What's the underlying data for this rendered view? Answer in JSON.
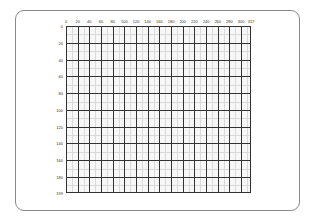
{
  "canvas": {
    "width_units": 317,
    "height_units": 199,
    "major_step": 20,
    "colors": {
      "frame_border": "#8a8a8a",
      "major_line": "#333333",
      "minor_line": "#d9d9d9",
      "grid_fill": "#f7f7f7"
    }
  },
  "x_axis": {
    "labels": [
      "0",
      "20",
      "40",
      "60",
      "80",
      "100",
      "120",
      "140",
      "160",
      "180",
      "200",
      "220",
      "240",
      "260",
      "280",
      "300",
      "317"
    ]
  },
  "y_axis": {
    "labels": [
      "0",
      "20",
      "40",
      "60",
      "80",
      "100",
      "120",
      "140",
      "160",
      "180",
      "199"
    ]
  }
}
